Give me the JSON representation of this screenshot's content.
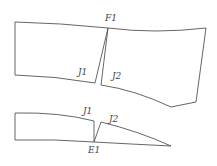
{
  "diagram": {
    "title": "",
    "labels": {
      "F1": "F1",
      "J1_top": "J1",
      "J2_top": "J2",
      "J1_bottom": "J1",
      "J2_bottom": "J2",
      "E1": "E1"
    },
    "colors": {
      "stroke": "#555555",
      "text": "#444444",
      "background": "#ffffff"
    },
    "pieces": [
      {
        "name": "upper-left-panel",
        "points": [
          [
            15,
            22
          ],
          [
            108,
            28
          ],
          [
            95,
            83
          ],
          [
            15,
            75
          ]
        ]
      },
      {
        "name": "upper-right-panel",
        "points": [
          [
            108,
            28
          ],
          [
            206,
            28
          ],
          [
            196,
            102
          ],
          [
            171,
            107
          ],
          [
            101,
            85
          ]
        ]
      },
      {
        "name": "lower-left-panel",
        "points": [
          [
            15,
            113
          ],
          [
            94,
            121
          ],
          [
            94,
            142
          ],
          [
            15,
            140
          ]
        ]
      },
      {
        "name": "lower-right-panel",
        "points": [
          [
            101,
            122
          ],
          [
            171,
            146
          ],
          [
            94,
            142
          ]
        ]
      }
    ]
  }
}
